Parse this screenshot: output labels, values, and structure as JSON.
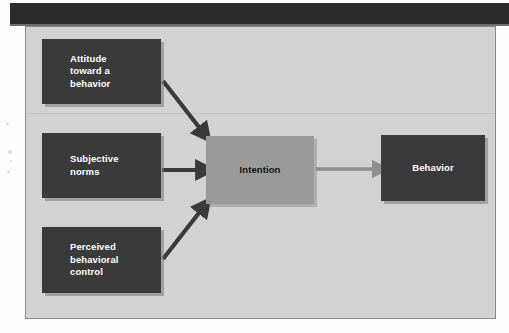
{
  "header": {
    "bar_color": "#2b2b2b"
  },
  "diagram": {
    "background_color": "#d2d2d2",
    "border_color": "#8a8a8a",
    "nodes": [
      {
        "id": "attitude",
        "label": "Attitude\ntoward a\nbehavior",
        "line1": "Attitude",
        "line2": "toward a",
        "line3": "behavior",
        "fill": "#3a3a3a",
        "text_color": "#ffffff"
      },
      {
        "id": "subjective-norms",
        "label": "Subjective\nnorms",
        "line1": "Subjective",
        "line2": "norms",
        "line3": "",
        "fill": "#3a3a3a",
        "text_color": "#ffffff"
      },
      {
        "id": "perceived-behavioral-control",
        "label": "Perceived\nbehavioral\ncontrol",
        "line1": "Perceived",
        "line2": "behavioral",
        "line3": "control",
        "fill": "#3a3a3a",
        "text_color": "#ffffff"
      },
      {
        "id": "intention",
        "label": "Intention",
        "line1": "Intention",
        "line2": "",
        "line3": "",
        "fill": "#9a9a9a",
        "text_color": "#111111"
      },
      {
        "id": "behavior",
        "label": "Behavior",
        "line1": "Behavior",
        "line2": "",
        "line3": "",
        "fill": "#3a3a3a",
        "text_color": "#ffffff"
      }
    ],
    "arrows": [
      {
        "id": "attitude-to-intention",
        "from": "attitude",
        "to": "intention",
        "color": "#3a3a3a",
        "direction": "diagonal-down-right"
      },
      {
        "id": "subjective-norms-to-intention",
        "from": "subjective-norms",
        "to": "intention",
        "color": "#3a3a3a",
        "direction": "right"
      },
      {
        "id": "perceived-control-to-intention",
        "from": "perceived-behavioral-control",
        "to": "intention",
        "color": "#3a3a3a",
        "direction": "diagonal-up-right"
      },
      {
        "id": "intention-to-behavior",
        "from": "intention",
        "to": "behavior",
        "color": "#8e8e8e",
        "direction": "right"
      }
    ]
  }
}
